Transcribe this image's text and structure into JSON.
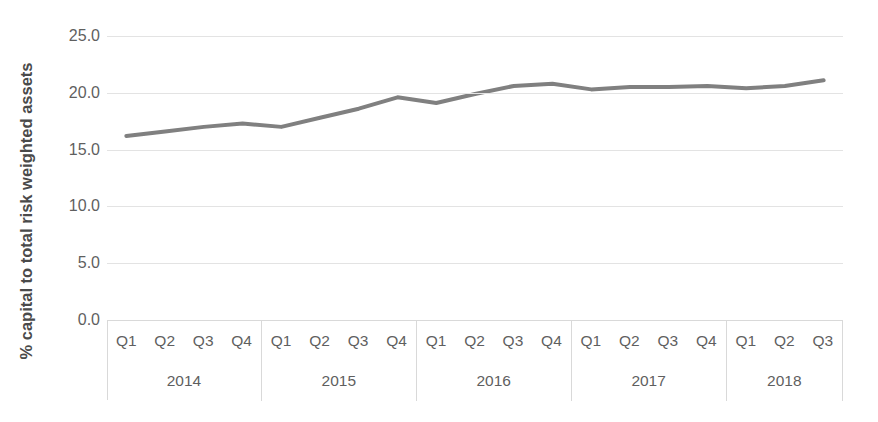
{
  "chart_data": {
    "type": "line",
    "title": "",
    "xlabel": "",
    "ylabel": "% capital to total risk weighted assets",
    "ylim": [
      0.0,
      25.0
    ],
    "yticks": [
      "0.0",
      "5.0",
      "10.0",
      "15.0",
      "20.0",
      "25.0"
    ],
    "ytick_values": [
      0.0,
      5.0,
      10.0,
      15.0,
      20.0,
      25.0
    ],
    "grid": true,
    "legend": "none",
    "line_color": "#808080",
    "gridline_color": "#e3e3e3",
    "axis_color": "#d9d9d9",
    "tick_label_color": "#5f5f5f",
    "categories": [
      "2014 Q1",
      "2014 Q2",
      "2014 Q3",
      "2014 Q4",
      "2015 Q1",
      "2015 Q2",
      "2015 Q3",
      "2015 Q4",
      "2016 Q1",
      "2016 Q2",
      "2016 Q3",
      "2016 Q4",
      "2017 Q1",
      "2017 Q2",
      "2017 Q3",
      "2017 Q4",
      "2018 Q1",
      "2018 Q2",
      "2018 Q3"
    ],
    "values": [
      16.2,
      16.6,
      17.0,
      17.3,
      17.0,
      17.8,
      18.6,
      19.6,
      19.1,
      19.9,
      20.6,
      20.8,
      20.3,
      20.5,
      20.5,
      20.6,
      20.4,
      20.6,
      21.1
    ],
    "x_axis_groups": [
      {
        "year": "2014",
        "quarters": [
          "Q1",
          "Q2",
          "Q3",
          "Q4"
        ]
      },
      {
        "year": "2015",
        "quarters": [
          "Q1",
          "Q2",
          "Q3",
          "Q4"
        ]
      },
      {
        "year": "2016",
        "quarters": [
          "Q1",
          "Q2",
          "Q3",
          "Q4"
        ]
      },
      {
        "year": "2017",
        "quarters": [
          "Q1",
          "Q2",
          "Q3",
          "Q4"
        ]
      },
      {
        "year": "2018",
        "quarters": [
          "Q1",
          "Q2",
          "Q3"
        ]
      }
    ]
  }
}
